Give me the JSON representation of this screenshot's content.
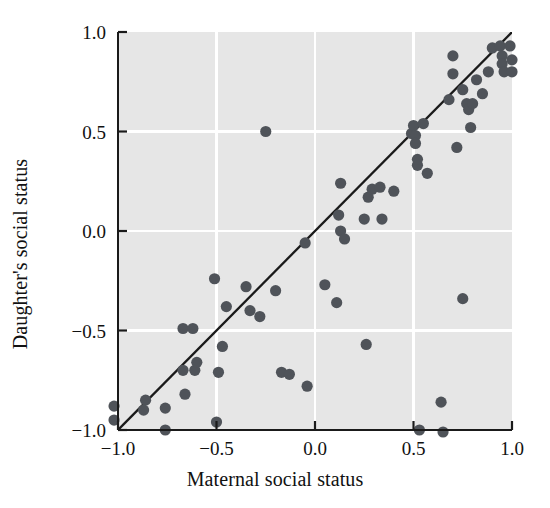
{
  "chart_data": {
    "type": "scatter",
    "title": "",
    "xlabel": "Maternal social status",
    "ylabel": "Daughter's social status",
    "xlim": [
      -1.0,
      1.0
    ],
    "ylim": [
      -1.0,
      1.0
    ],
    "xticks": [
      -1.0,
      -0.5,
      0.0,
      0.5,
      1.0
    ],
    "yticks": [
      -1.0,
      -0.5,
      0.0,
      0.5,
      1.0
    ],
    "xtick_labels": [
      "−1.0",
      "−0.5",
      "0.0",
      "0.5",
      "1.0"
    ],
    "ytick_labels": [
      "−1.0",
      "−0.5",
      "0.0",
      "0.5",
      "1.0"
    ],
    "grid": true,
    "grid_color": "#ffffff",
    "plot_background": "#e6e6e6",
    "point_color": "#4f5359",
    "point_size": 7,
    "legend": null,
    "legend_position": "none",
    "reference_line": {
      "type": "line",
      "label": "y = x identity line",
      "color": "#1a1a1a",
      "x": [
        -1.0,
        1.0
      ],
      "y": [
        -1.0,
        1.0
      ]
    },
    "series": [
      {
        "name": "Mother-daughter social status pairs",
        "points": [
          [
            -1.02,
            -0.88
          ],
          [
            -1.02,
            -0.95
          ],
          [
            -0.86,
            -0.85
          ],
          [
            -0.87,
            -0.9
          ],
          [
            -0.76,
            -0.89
          ],
          [
            -0.76,
            -1.0
          ],
          [
            -0.67,
            -0.7
          ],
          [
            -0.67,
            -0.49
          ],
          [
            -0.66,
            -0.82
          ],
          [
            -0.62,
            -0.49
          ],
          [
            -0.61,
            -0.7
          ],
          [
            -0.6,
            -0.66
          ],
          [
            -0.51,
            -0.24
          ],
          [
            -0.5,
            -0.96
          ],
          [
            -0.49,
            -0.71
          ],
          [
            -0.47,
            -0.58
          ],
          [
            -0.45,
            -0.38
          ],
          [
            -0.35,
            -0.28
          ],
          [
            -0.33,
            -0.4
          ],
          [
            -0.28,
            -0.43
          ],
          [
            -0.25,
            0.5
          ],
          [
            -0.2,
            -0.3
          ],
          [
            -0.17,
            -0.71
          ],
          [
            -0.13,
            -0.72
          ],
          [
            -0.05,
            -0.06
          ],
          [
            -0.04,
            -0.78
          ],
          [
            0.05,
            -0.27
          ],
          [
            0.11,
            -0.36
          ],
          [
            0.12,
            0.08
          ],
          [
            0.13,
            0.0
          ],
          [
            0.13,
            0.24
          ],
          [
            0.15,
            -0.04
          ],
          [
            0.25,
            0.06
          ],
          [
            0.26,
            -0.57
          ],
          [
            0.27,
            0.17
          ],
          [
            0.29,
            0.21
          ],
          [
            0.33,
            0.22
          ],
          [
            0.34,
            0.06
          ],
          [
            0.4,
            0.2
          ],
          [
            0.49,
            0.49
          ],
          [
            0.5,
            0.53
          ],
          [
            0.51,
            0.48
          ],
          [
            0.51,
            0.44
          ],
          [
            0.52,
            0.33
          ],
          [
            0.52,
            0.36
          ],
          [
            0.53,
            -1.0
          ],
          [
            0.55,
            0.54
          ],
          [
            0.57,
            0.29
          ],
          [
            0.64,
            -0.86
          ],
          [
            0.65,
            -1.01
          ],
          [
            0.68,
            0.66
          ],
          [
            0.7,
            0.88
          ],
          [
            0.7,
            0.79
          ],
          [
            0.72,
            0.42
          ],
          [
            0.75,
            0.71
          ],
          [
            0.75,
            -0.34
          ],
          [
            0.77,
            0.64
          ],
          [
            0.78,
            0.61
          ],
          [
            0.79,
            0.52
          ],
          [
            0.8,
            0.64
          ],
          [
            0.82,
            0.76
          ],
          [
            0.85,
            0.69
          ],
          [
            0.88,
            0.8
          ],
          [
            0.9,
            0.92
          ],
          [
            0.94,
            0.93
          ],
          [
            0.95,
            0.88
          ],
          [
            0.95,
            0.84
          ],
          [
            0.96,
            0.8
          ],
          [
            0.99,
            0.93
          ],
          [
            1.0,
            0.86
          ],
          [
            1.0,
            0.8
          ]
        ]
      }
    ]
  },
  "figure": {
    "x_axis_label": "Maternal social status",
    "y_axis_label": "Daughter's social status"
  }
}
